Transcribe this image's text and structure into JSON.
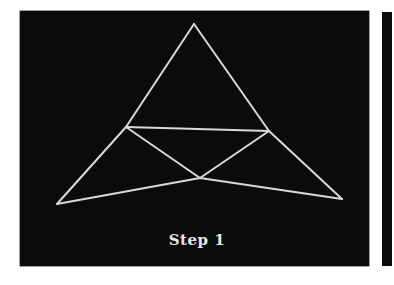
{
  "figure": {
    "caption": "Step 1",
    "background_color": "#0b0b0b",
    "line_color": "#d9d9d9",
    "vertices": {
      "apex": [
        194,
        24
      ],
      "bottom_left": [
        57,
        204
      ],
      "bottom_right": [
        342,
        199
      ],
      "mid_left": [
        126,
        127
      ],
      "mid_right": [
        269,
        131
      ],
      "inner_bottom": [
        200,
        178
      ]
    },
    "segments": [
      [
        "apex",
        "mid_left"
      ],
      [
        "mid_left",
        "bottom_left"
      ],
      [
        "apex",
        "mid_right"
      ],
      [
        "mid_right",
        "bottom_right"
      ],
      [
        "mid_left",
        "mid_right"
      ],
      [
        "mid_left",
        "inner_bottom"
      ],
      [
        "mid_right",
        "inner_bottom"
      ],
      [
        "bottom_left",
        "inner_bottom"
      ],
      [
        "inner_bottom",
        "bottom_right"
      ]
    ]
  }
}
